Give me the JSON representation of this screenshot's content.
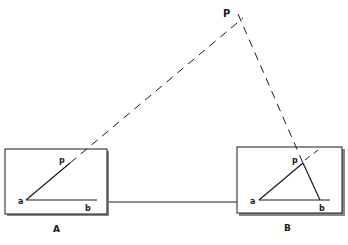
{
  "diagram": {
    "point_label": "P",
    "boards": [
      {
        "label": "A",
        "vertex_a": "a",
        "vertex_b": "b",
        "vertex_p": "p"
      },
      {
        "label": "B",
        "vertex_a": "a",
        "vertex_b": "b",
        "vertex_p": "p"
      }
    ],
    "colors": {
      "ink": "#1a1a1a",
      "board_shadow": "#555555",
      "background": "#ffffff"
    }
  }
}
